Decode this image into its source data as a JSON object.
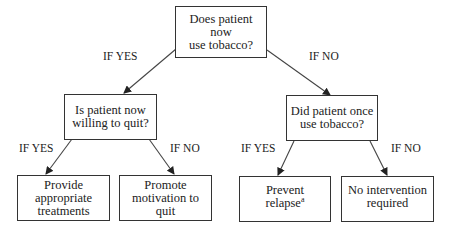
{
  "diagram": {
    "type": "decision-tree",
    "nodes": {
      "root": {
        "text": "Does patient now use tobacco?",
        "lines": [
          "Does patient now",
          "use tobacco?"
        ]
      },
      "willing": {
        "text": "Is patient now willing to quit?",
        "lines": [
          "Is patient now",
          "willing to quit?"
        ]
      },
      "once": {
        "text": "Did patient once use tobacco?",
        "lines": [
          "Did patient once",
          "use tobacco?"
        ]
      },
      "treat": {
        "text": "Provide appropriate treatments",
        "lines": [
          "Provide",
          "appropriate",
          "treatments"
        ]
      },
      "motivate": {
        "text": "Promote motivation to quit",
        "lines": [
          "Promote",
          "motivation to",
          "quit"
        ]
      },
      "relapse": {
        "text": "Prevent relapse",
        "lines": [
          "Prevent",
          "relapse"
        ],
        "footnote_marker": "a"
      },
      "none": {
        "text": "No intervention required",
        "lines": [
          "No intervention",
          "required"
        ]
      }
    },
    "edges": [
      {
        "from": "root",
        "to": "willing",
        "label": "IF YES"
      },
      {
        "from": "root",
        "to": "once",
        "label": "IF NO"
      },
      {
        "from": "willing",
        "to": "treat",
        "label": "IF YES"
      },
      {
        "from": "willing",
        "to": "motivate",
        "label": "IF NO"
      },
      {
        "from": "once",
        "to": "relapse",
        "label": "IF YES"
      },
      {
        "from": "once",
        "to": "none",
        "label": "IF NO"
      }
    ]
  }
}
